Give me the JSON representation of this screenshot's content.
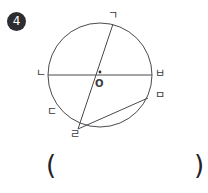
{
  "problem": {
    "number": "4",
    "badge_color": "#2e2e32",
    "stroke_color": "#4a4a50",
    "text_color": "#3a3a3e"
  },
  "figure": {
    "type": "circle-geometry-diagram",
    "circle": {
      "cx": 100,
      "cy": 75,
      "r": 52
    },
    "center_label": "O",
    "center_dot": true,
    "points": [
      {
        "id": "g",
        "label": "ㄱ",
        "x": 113,
        "y": 24
      },
      {
        "id": "n",
        "label": "ㄴ",
        "x": 48,
        "y": 75
      },
      {
        "id": "b",
        "label": "ㅂ",
        "x": 152,
        "y": 75
      },
      {
        "id": "m",
        "label": "ㅁ",
        "x": 148,
        "y": 98
      },
      {
        "id": "d",
        "label": "ㄷ",
        "x": 58,
        "y": 112
      },
      {
        "id": "r",
        "label": "ㄹ",
        "x": 78,
        "y": 129
      }
    ],
    "segments": [
      {
        "from": "n",
        "to": "b",
        "kind": "diameter"
      },
      {
        "from": "g",
        "to": "r",
        "kind": "chord"
      },
      {
        "from": "r",
        "to": "m",
        "kind": "chord"
      }
    ]
  },
  "answer": {
    "open_paren": "(",
    "close_paren": ")",
    "value": ""
  }
}
